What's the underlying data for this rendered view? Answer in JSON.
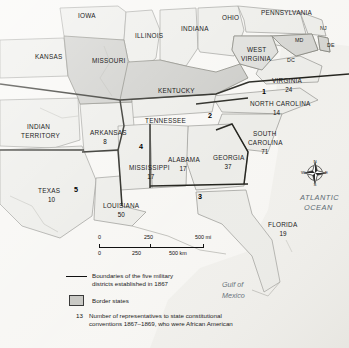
{
  "map": {
    "title": "Reconstruction Military Districts Map",
    "background_color": "#f7f6f3",
    "border_state_fill": "#c9c9c5",
    "plain_state_fill": "#ebebe7",
    "water_fill": "#f0efeb",
    "states": [
      {
        "name": "IOWA",
        "num": "",
        "x": 78,
        "y": 13,
        "shaded": false
      },
      {
        "name": "ILLINOIS",
        "num": "",
        "x": 135,
        "y": 33,
        "shaded": false
      },
      {
        "name": "INDIANA",
        "num": "",
        "x": 181,
        "y": 26,
        "shaded": false
      },
      {
        "name": "OHIO",
        "num": "",
        "x": 222,
        "y": 15,
        "shaded": false
      },
      {
        "name": "PENNSYLVANIA",
        "num": "",
        "x": 261,
        "y": 10,
        "shaded": false
      },
      {
        "name": "NJ",
        "num": "",
        "x": 320,
        "y": 26,
        "shaded": false
      },
      {
        "name": "DE",
        "num": "",
        "x": 327,
        "y": 43,
        "shaded": false
      },
      {
        "name": "MD",
        "num": "",
        "x": 295,
        "y": 38,
        "shaded": false
      },
      {
        "name": "DC",
        "num": "",
        "x": 287,
        "y": 58,
        "shaded": false
      },
      {
        "name": "WEST",
        "num": "",
        "x": 247,
        "y": 47,
        "shaded": false
      },
      {
        "name": "VIRGINIA",
        "num": "",
        "x": 241,
        "y": 56,
        "shaded": false
      },
      {
        "name": "KANSAS",
        "num": "",
        "x": 35,
        "y": 54,
        "shaded": false
      },
      {
        "name": "MISSOURI",
        "num": "",
        "x": 92,
        "y": 58,
        "shaded": true
      },
      {
        "name": "KENTUCKY",
        "num": "",
        "x": 158,
        "y": 88,
        "shaded": true
      },
      {
        "name": "VIRGINIA",
        "num": "24",
        "x": 272,
        "y": 78,
        "shaded": false
      },
      {
        "name": "NORTH CAROLINA",
        "num": "14",
        "x": 250,
        "y": 101,
        "shaded": false
      },
      {
        "name": "TENNESSEE",
        "num": "",
        "x": 145,
        "y": 118,
        "shaded": false
      },
      {
        "name": "INDIAN",
        "num": "",
        "x": 27,
        "y": 124,
        "shaded": false
      },
      {
        "name": "TERRITORY",
        "num": "",
        "x": 21,
        "y": 133,
        "shaded": false
      },
      {
        "name": "ARKANSAS",
        "num": "8",
        "x": 90,
        "y": 130,
        "shaded": false
      },
      {
        "name": "SOUTH",
        "num": "",
        "x": 253,
        "y": 131,
        "shaded": false
      },
      {
        "name": "CAROLINA",
        "num": "71",
        "x": 248,
        "y": 140,
        "shaded": false
      },
      {
        "name": "ALABAMA",
        "num": "17",
        "x": 168,
        "y": 157,
        "shaded": false
      },
      {
        "name": "GEORGIA",
        "num": "37",
        "x": 213,
        "y": 155,
        "shaded": false
      },
      {
        "name": "MISSISSIPPI",
        "num": "17",
        "x": 129,
        "y": 165,
        "shaded": false
      },
      {
        "name": "TEXAS",
        "num": "10",
        "x": 38,
        "y": 188,
        "shaded": false
      },
      {
        "name": "LOUISIANA",
        "num": "50",
        "x": 103,
        "y": 203,
        "shaded": false
      },
      {
        "name": "FLORIDA",
        "num": "19",
        "x": 268,
        "y": 222,
        "shaded": false
      }
    ],
    "district_numbers": [
      {
        "label": "1",
        "x": 262,
        "y": 88
      },
      {
        "label": "2",
        "x": 208,
        "y": 112
      },
      {
        "label": "3",
        "x": 198,
        "y": 193
      },
      {
        "label": "4",
        "x": 139,
        "y": 143
      },
      {
        "label": "5",
        "x": 74,
        "y": 186
      }
    ],
    "water_labels": [
      {
        "text": "ATLANTIC",
        "x": 300,
        "y": 193
      },
      {
        "text": "OCEAN",
        "x": 304,
        "y": 203
      }
    ],
    "gulf_label": {
      "line1": "Gulf of",
      "line2": "Mexico",
      "x": 222,
      "y": 280
    },
    "compass": {
      "north": "N",
      "east": "E",
      "south": "S",
      "west": "W"
    }
  },
  "scalebar": {
    "miles": {
      "ticks": [
        "0",
        "250",
        "500 mi"
      ]
    },
    "kilometers": {
      "ticks": [
        "0",
        "250",
        "500 km"
      ]
    }
  },
  "legend": {
    "boundaries_line1": "Boundaries of the five military",
    "boundaries_line2": "districts established in 1867",
    "border_states": "Border states",
    "number_sample": "13",
    "number_line1": "Number of representatives to state constitutional",
    "number_line2": "conventions 1867–1869, who were African American"
  }
}
